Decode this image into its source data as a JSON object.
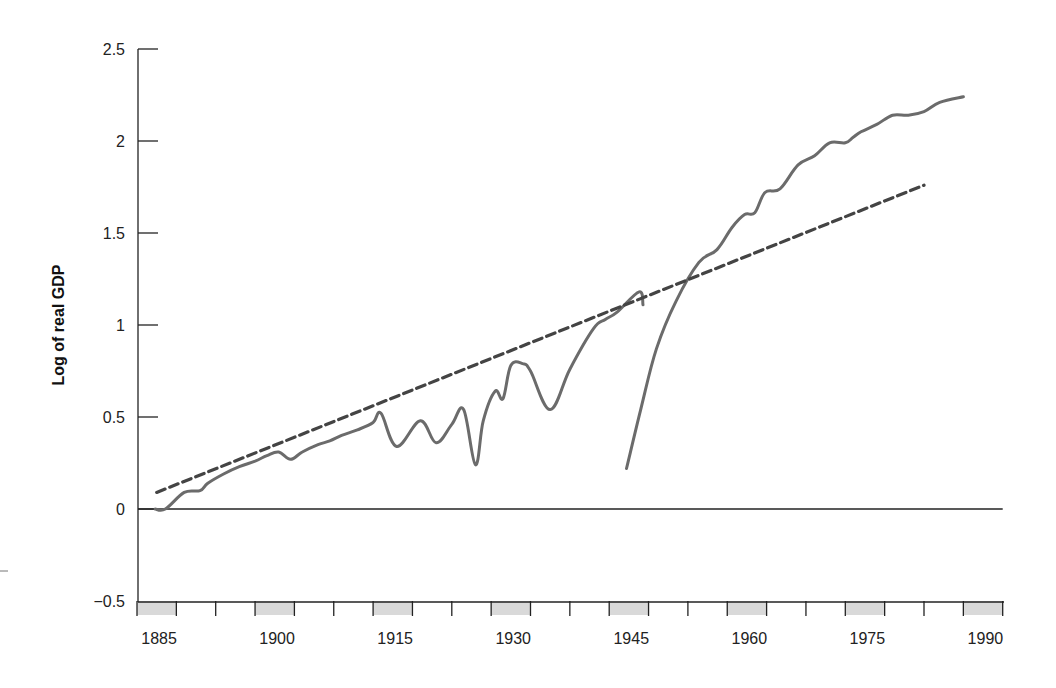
{
  "chart_data": {
    "type": "line",
    "title": "",
    "xlabel": "",
    "ylabel": "Log of real GDP",
    "xlim": [
      1885,
      1995
    ],
    "ylim": [
      -0.5,
      2.5
    ],
    "grid": false,
    "legend": null,
    "y_ticks": [
      {
        "value": 2.5,
        "label": "2.5"
      },
      {
        "value": 2,
        "label": "2"
      },
      {
        "value": 1.5,
        "label": "1.5"
      },
      {
        "value": 1,
        "label": "1"
      },
      {
        "value": 0.5,
        "label": "0.5"
      },
      {
        "value": 0,
        "label": "0"
      },
      {
        "value": -0.5,
        "label": "−0.5"
      }
    ],
    "x_tick_years": [
      1885,
      1890,
      1895,
      1900,
      1905,
      1910,
      1915,
      1920,
      1925,
      1930,
      1935,
      1940,
      1945,
      1950,
      1955,
      1960,
      1965,
      1970,
      1975,
      1980,
      1985,
      1990,
      1995
    ],
    "x_labels": [
      {
        "year": 1885,
        "label": "1885"
      },
      {
        "year": 1900,
        "label": "1900"
      },
      {
        "year": 1915,
        "label": "1915"
      },
      {
        "year": 1930,
        "label": "1930"
      },
      {
        "year": 1945,
        "label": "1945"
      },
      {
        "year": 1960,
        "label": "1960"
      },
      {
        "year": 1975,
        "label": "1975"
      },
      {
        "year": 1990,
        "label": "1990"
      }
    ],
    "shaded_intervals": [
      [
        1885,
        1890
      ],
      [
        1900,
        1905
      ],
      [
        1915,
        1920
      ],
      [
        1930,
        1935
      ],
      [
        1945,
        1950
      ],
      [
        1960,
        1965
      ],
      [
        1975,
        1980
      ],
      [
        1990,
        1995
      ]
    ],
    "series": [
      {
        "name": "Log of real GDP (segment 1)",
        "style": "solid",
        "color": "#6b6b6b",
        "x": [
          1887.3,
          1888.6,
          1891,
          1893,
          1894,
          1896,
          1898,
          1900,
          1901.5,
          1903,
          1904.5,
          1906,
          1908,
          1909.5,
          1911,
          1913,
          1915,
          1916,
          1918,
          1921,
          1923,
          1925,
          1926.5,
          1928,
          1929,
          1930.5,
          1931.5,
          1932.5,
          1934,
          1935,
          1937.5,
          1940,
          1943,
          1944.5,
          1946,
          1948.8,
          1949.3
        ],
        "values": [
          0.0,
          0.0,
          0.09,
          0.1,
          0.14,
          0.19,
          0.23,
          0.26,
          0.29,
          0.31,
          0.27,
          0.31,
          0.35,
          0.37,
          0.4,
          0.43,
          0.47,
          0.52,
          0.34,
          0.48,
          0.36,
          0.46,
          0.54,
          0.24,
          0.48,
          0.64,
          0.6,
          0.78,
          0.79,
          0.75,
          0.54,
          0.76,
          0.98,
          1.03,
          1.07,
          1.18,
          1.11
        ]
      },
      {
        "name": "Log of real GDP (segment 2)",
        "style": "solid",
        "color": "#6b6b6b",
        "x": [
          1947.2,
          1949,
          1951,
          1953.5,
          1956.4,
          1958.7,
          1960.6,
          1962.2,
          1963.5,
          1964.8,
          1966.7,
          1969,
          1971.1,
          1973,
          1975,
          1976,
          1977,
          1979,
          1981,
          1983,
          1985,
          1987,
          1990
        ],
        "values": [
          0.22,
          0.54,
          0.87,
          1.13,
          1.34,
          1.41,
          1.53,
          1.6,
          1.61,
          1.72,
          1.74,
          1.87,
          1.92,
          1.99,
          1.99,
          2.02,
          2.05,
          2.09,
          2.14,
          2.14,
          2.16,
          2.21,
          2.24
        ]
      },
      {
        "name": "Trend",
        "style": "dashed",
        "color": "#444444",
        "x": [
          1887.5,
          1985
        ],
        "values": [
          0.09,
          1.76
        ]
      }
    ],
    "reference_lines": [
      {
        "y": 0,
        "from_year": 1885,
        "to_year": 1995
      }
    ]
  },
  "axes": {
    "ylabel": "Log of real GDP"
  }
}
